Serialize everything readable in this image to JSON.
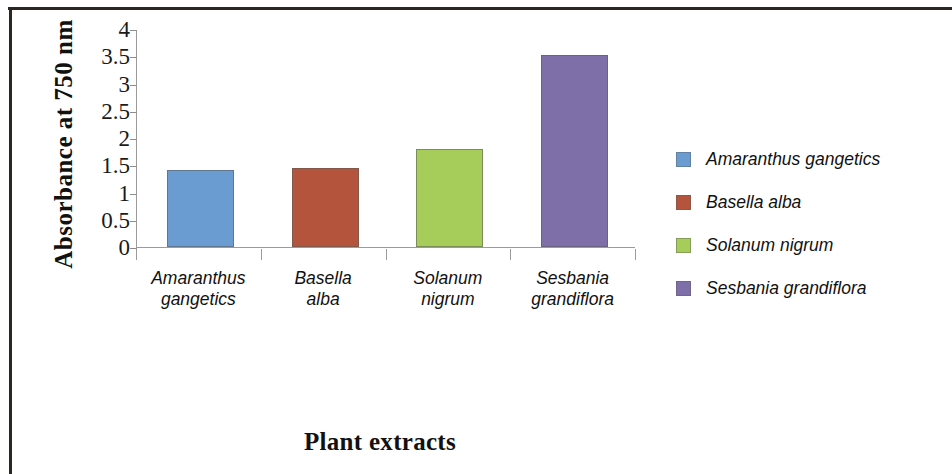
{
  "chart_data": {
    "type": "bar",
    "title": "",
    "categories": [
      "Amaranthus gangetics",
      "Basella alba",
      "Solanum nigrum",
      "Sesbania grandiflora"
    ],
    "category_lines": [
      [
        "Amaranthus",
        "gangetics"
      ],
      [
        "Basella",
        "alba"
      ],
      [
        "Solanum",
        "nigrum"
      ],
      [
        "Sesbania",
        "grandiflora"
      ]
    ],
    "values": [
      1.41,
      1.45,
      1.8,
      3.53
    ],
    "colors": [
      "#6A9BD1",
      "#B4543C",
      "#A6CC5A",
      "#7E6FA8"
    ],
    "xlabel": "Plant extracts",
    "ylabel": "Absorbance at 750 nm",
    "ylim": [
      0,
      4
    ],
    "ytick_labels": [
      "4",
      "3.5",
      "3",
      "2.5",
      "2",
      "1.5",
      "1",
      "0.5",
      "0"
    ],
    "ytick_values": [
      4,
      3.5,
      3,
      2.5,
      2,
      1.5,
      1,
      0.5,
      0
    ],
    "grid": false,
    "legend_position": "right",
    "legend": [
      {
        "label": "Amaranthus  gangetics",
        "color": "#6A9BD1"
      },
      {
        "label": "Basella alba",
        "color": "#B4543C"
      },
      {
        "label": "Solanum nigrum",
        "color": "#A6CC5A"
      },
      {
        "label": "Sesbania grandiflora",
        "color": "#7E6FA8"
      }
    ]
  }
}
